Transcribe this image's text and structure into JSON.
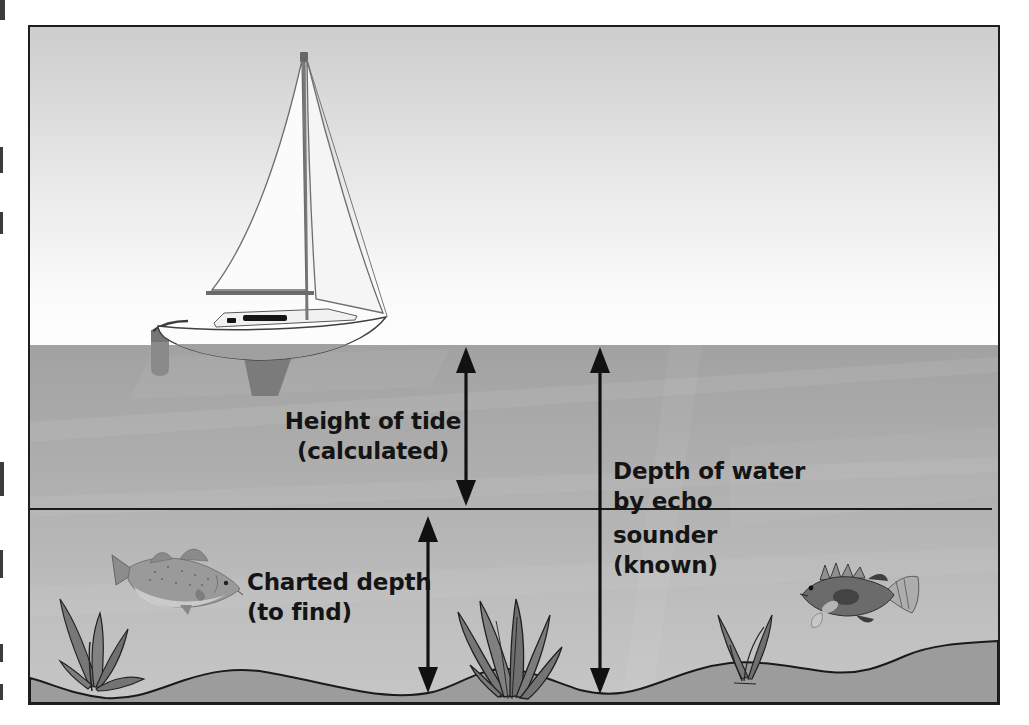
{
  "diagram": {
    "type": "tide-and-depth-diagram",
    "labels": {
      "height_of_tide": {
        "lines": [
          "Height of tide",
          "(calculated)"
        ]
      },
      "depth_of_water": {
        "lines": [
          "Depth of water",
          "by echo",
          "sounder",
          "(known)"
        ]
      },
      "charted_depth": {
        "lines": [
          "Charted depth",
          "(to find)"
        ]
      }
    },
    "illustrations": {
      "sailboat": "sailboat",
      "fish_left": "cod-fish-swimming-right",
      "fish_right": "rockfish-swimming-left",
      "plant_left": "seaweed-clump",
      "plant_middle": "seaweed-clump",
      "plant_right": "seaweed-clump"
    },
    "colors": {
      "page_background": "#ffffff",
      "frame_border": "#1e1e1e",
      "sky_top": "#cdcdcd",
      "sky_bottom": "#fefefe",
      "water_top": "#a2a2a2",
      "water_bottom": "#c6c6c6",
      "sand": "#9c9c9c",
      "line_color": "#1a1a1a",
      "text_color": "#141414"
    }
  }
}
